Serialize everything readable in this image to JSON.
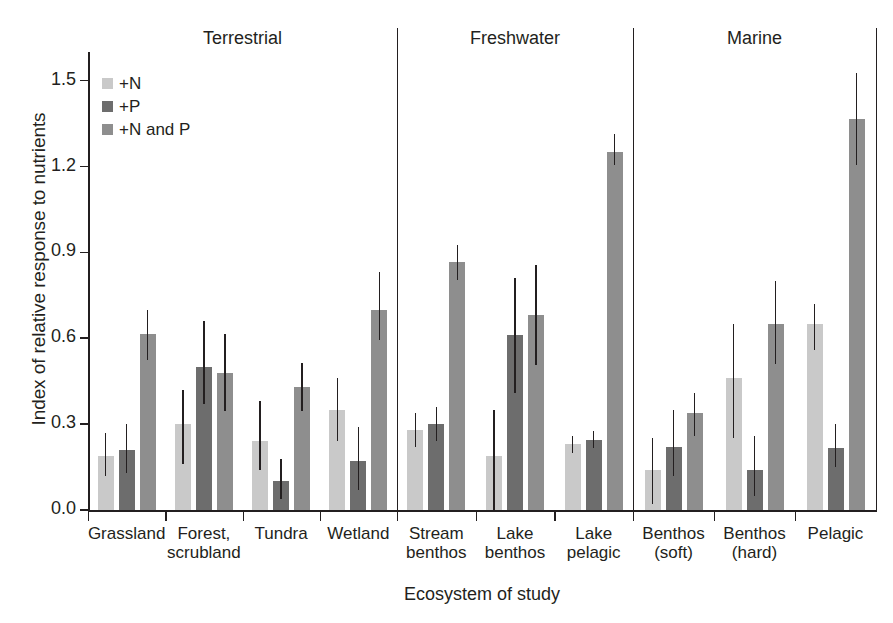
{
  "chart_data": {
    "type": "bar",
    "title": "",
    "xlabel": "Ecosystem of study",
    "ylabel": "Index of relative response to nutrients",
    "ylim": [
      0.0,
      1.6
    ],
    "yticks": [
      "0.0",
      "0.3",
      "0.6",
      "0.9",
      "1.2",
      "1.5"
    ],
    "ytick_values": [
      0.0,
      0.3,
      0.6,
      0.9,
      1.2,
      1.5
    ],
    "grid": false,
    "legend_position": "upper-left-inside",
    "legend": [
      "+N",
      "+P",
      "+N and P"
    ],
    "series": [
      {
        "name": "+N",
        "color": "#c9c9c9",
        "values": [
          0.19,
          0.3,
          0.24,
          0.35,
          0.28,
          0.19,
          0.23,
          0.14,
          0.46,
          0.65
        ],
        "err_low": [
          0.12,
          0.16,
          0.14,
          0.24,
          0.22,
          0.0,
          0.2,
          0.02,
          0.25,
          0.56
        ],
        "err_high": [
          0.27,
          0.42,
          0.38,
          0.46,
          0.34,
          0.35,
          0.26,
          0.25,
          0.65,
          0.72
        ]
      },
      {
        "name": "+P",
        "color": "#6d6d6d",
        "values": [
          0.21,
          0.5,
          0.1,
          0.17,
          0.3,
          0.61,
          0.245,
          0.22,
          0.14,
          0.215
        ],
        "err_low": [
          0.13,
          0.37,
          0.04,
          0.07,
          0.24,
          0.41,
          0.215,
          0.12,
          0.05,
          0.15
        ],
        "err_high": [
          0.3,
          0.66,
          0.18,
          0.29,
          0.36,
          0.81,
          0.275,
          0.35,
          0.26,
          0.3
        ]
      },
      {
        "name": "+N and P",
        "color": "#8e8e8e",
        "values": [
          0.615,
          0.48,
          0.43,
          0.7,
          0.865,
          0.68,
          1.25,
          0.34,
          0.65,
          1.365
        ],
        "err_low": [
          0.525,
          0.345,
          0.345,
          0.595,
          0.805,
          0.505,
          1.205,
          0.26,
          0.51,
          1.205
        ],
        "err_high": [
          0.7,
          0.615,
          0.515,
          0.83,
          0.925,
          0.855,
          1.315,
          0.41,
          0.8,
          1.525
        ]
      }
    ],
    "categories": [
      "Grassland",
      "Forest,\nscrubland",
      "Tundra",
      "Wetland",
      "Stream\nbenthos",
      "Lake\nbenthos",
      "Lake\npelagic",
      "Benthos\n(soft)",
      "Benthos\n(hard)",
      "Pelagic"
    ],
    "groups": [
      {
        "label": "Terrestrial",
        "categories": [
          "Grassland",
          "Forest, scrubland",
          "Tundra",
          "Wetland"
        ]
      },
      {
        "label": "Freshwater",
        "categories": [
          "Stream benthos",
          "Lake benthos",
          "Lake pelagic"
        ]
      },
      {
        "label": "Marine",
        "categories": [
          "Benthos (soft)",
          "Benthos (hard)",
          "Pelagic"
        ]
      }
    ]
  },
  "axes": {
    "ylabel": "Index of relative response to nutrients",
    "xlabel": "Ecosystem of study",
    "yticks": [
      "0.0",
      "0.3",
      "0.6",
      "0.9",
      "1.2",
      "1.5"
    ]
  },
  "legend": {
    "items": [
      {
        "label": "+N",
        "color": "#c9c9c9"
      },
      {
        "label": "+P",
        "color": "#6d6d6d"
      },
      {
        "label": "+N and P",
        "color": "#8e8e8e"
      }
    ]
  },
  "groups": [
    {
      "label": "Terrestrial"
    },
    {
      "label": "Freshwater"
    },
    {
      "label": "Marine"
    }
  ],
  "categories": [
    {
      "line1": "Grassland",
      "line2": ""
    },
    {
      "line1": "Forest,",
      "line2": "scrubland"
    },
    {
      "line1": "Tundra",
      "line2": ""
    },
    {
      "line1": "Wetland",
      "line2": ""
    },
    {
      "line1": "Stream",
      "line2": "benthos"
    },
    {
      "line1": "Lake",
      "line2": "benthos"
    },
    {
      "line1": "Lake",
      "line2": "pelagic"
    },
    {
      "line1": "Benthos",
      "line2": "(soft)"
    },
    {
      "line1": "Benthos",
      "line2": "(hard)"
    },
    {
      "line1": "Pelagic",
      "line2": ""
    }
  ]
}
